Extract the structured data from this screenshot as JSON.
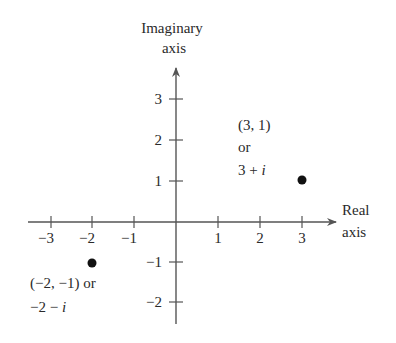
{
  "diagram": {
    "type": "complex-plane",
    "y_axis_label_line1": "Imaginary",
    "y_axis_label_line2": "axis",
    "x_axis_label_line1": "Real",
    "x_axis_label_line2": "axis",
    "x_ticks": [
      "−3",
      "−2",
      "−1",
      "1",
      "2",
      "3"
    ],
    "y_ticks": [
      "3",
      "2",
      "1",
      "−1",
      "−2"
    ],
    "points": [
      {
        "coord": "(3, 1)",
        "or": "or",
        "complex_prefix": "3 + ",
        "complex_i": "i",
        "x": 3,
        "y": 1
      },
      {
        "coord": "(−2, −1) or",
        "complex_prefix": "−2 − ",
        "complex_i": "i",
        "x": -2,
        "y": -1
      }
    ],
    "colors": {
      "axis": "#555555",
      "text": "#2a2a2a",
      "point": "#111111"
    }
  }
}
